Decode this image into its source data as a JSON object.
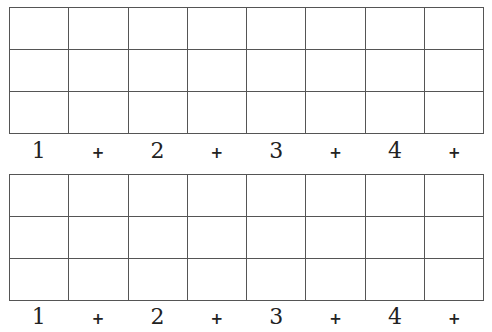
{
  "worksheet": {
    "grids": [
      {
        "rows": 3,
        "cols": 8,
        "labels": [
          "1",
          "+",
          "2",
          "+",
          "3",
          "+",
          "4",
          "+"
        ]
      },
      {
        "rows": 3,
        "cols": 8,
        "labels": [
          "1",
          "+",
          "2",
          "+",
          "3",
          "+",
          "4",
          "+"
        ]
      }
    ]
  }
}
